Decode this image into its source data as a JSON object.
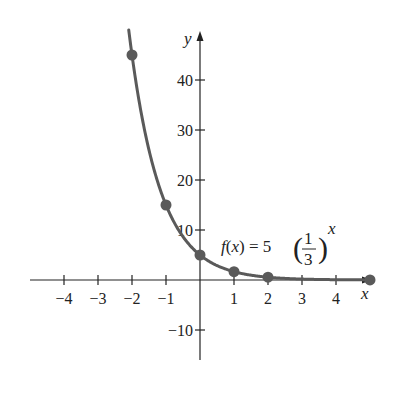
{
  "chart_data": {
    "type": "line",
    "title": "",
    "function_label": "f(x) = 5(1/3)^x",
    "function_parts": {
      "lhs_f": "f",
      "lhs_open": "(",
      "lhs_x": "x",
      "lhs_close": ")",
      "eq": " = 5",
      "num": "1",
      "den": "3",
      "exp": "x"
    },
    "xlabel": "x",
    "ylabel": "y",
    "x_ticks": [
      -4,
      -3,
      -2,
      -1,
      1,
      2,
      3,
      4
    ],
    "x_tick_labels": [
      "−4",
      "−3",
      "−2",
      "−1",
      "1",
      "2",
      "3",
      "4"
    ],
    "y_ticks": [
      40,
      30,
      20,
      10,
      -10
    ],
    "y_tick_labels": [
      "40",
      "30",
      "20",
      "10",
      "−10"
    ],
    "xlim": [
      -5,
      5
    ],
    "ylim": [
      -15,
      50
    ],
    "grid": false,
    "points": [
      {
        "x": -2,
        "y": 45
      },
      {
        "x": -1,
        "y": 15
      },
      {
        "x": 0,
        "y": 5
      },
      {
        "x": 1,
        "y": 1.67
      },
      {
        "x": 2,
        "y": 0.56
      },
      {
        "x": 5,
        "y": 0.02
      }
    ],
    "curve_color": "#5a5a5a",
    "point_color": "#5a5a5a",
    "axis_color": "#222222"
  }
}
